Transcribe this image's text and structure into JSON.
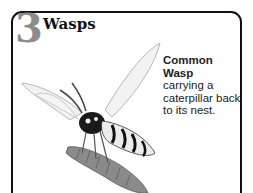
{
  "section": {
    "number": "3",
    "title": "Wasps"
  },
  "caption": {
    "heading_line1": "Common",
    "heading_line2": "Wasp",
    "body": "carrying a caterpillar back to its nest."
  },
  "illustration": {
    "subject": "common-wasp-carrying-caterpillar",
    "colors": {
      "dark": "#1a1a1a",
      "mid": "#8a8a8a",
      "light": "#e6e6e6"
    }
  }
}
